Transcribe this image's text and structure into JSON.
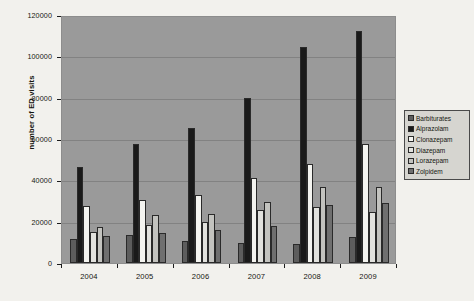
{
  "chart_data": {
    "type": "bar",
    "title": "",
    "xlabel": "",
    "ylabel": "number of ED visits",
    "categories": [
      "2004",
      "2005",
      "2006",
      "2007",
      "2008",
      "2009"
    ],
    "ylim": [
      0,
      120000
    ],
    "ytick_labels": [
      "0",
      "20000",
      "40000",
      "60000",
      "80000",
      "100000",
      "120000"
    ],
    "ytick_values": [
      0,
      20000,
      40000,
      60000,
      80000,
      100000,
      120000
    ],
    "grid": true,
    "legend_position": "right",
    "plot_background": "#9a9a9a",
    "series": [
      {
        "name": "Barbiturates",
        "color": "#5d5d5d",
        "values": [
          11500,
          13500,
          10500,
          9500,
          9000,
          12500
        ]
      },
      {
        "name": "Alprazolam",
        "color": "#1a1a1a",
        "values": [
          46500,
          57500,
          65500,
          80000,
          104500,
          112500
        ]
      },
      {
        "name": "Clonazepam",
        "color": "#f4f4f0",
        "values": [
          27500,
          30500,
          33000,
          41000,
          48000,
          57500
        ]
      },
      {
        "name": "Diazepam",
        "color": "#e2e2de",
        "values": [
          15000,
          18500,
          20000,
          25500,
          27000,
          24500
        ]
      },
      {
        "name": "Lorazepam",
        "color": "#c3c3bf",
        "values": [
          17500,
          23000,
          23500,
          29500,
          37000,
          37000
        ]
      },
      {
        "name": "Zolpidem",
        "color": "#6f6f6f",
        "values": [
          13000,
          14500,
          16000,
          18000,
          28000,
          29000
        ]
      }
    ]
  },
  "legend": {
    "items": [
      {
        "label": "Barbiturates"
      },
      {
        "label": "Alprazolam"
      },
      {
        "label": "Clonazepam"
      },
      {
        "label": "Diazepam"
      },
      {
        "label": "Lorazepam"
      },
      {
        "label": "Zolpidem"
      }
    ]
  }
}
